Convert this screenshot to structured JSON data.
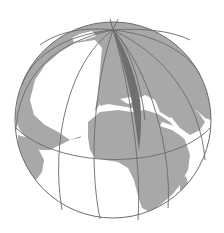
{
  "figure": {
    "center": [
      113,
      120
    ],
    "radius": 98,
    "pole": [
      113,
      30
    ],
    "colors": {
      "ocean": "#ffffff",
      "land": "#a8a8a8",
      "highlight_wedge": "#6f6f6f",
      "grid_lines": "#6a6a6a",
      "outline": "#6a6a6a"
    },
    "elements": [
      "sphere-outline",
      "continents",
      "meridians",
      "equator",
      "highlighted-meridian-wedge"
    ]
  }
}
